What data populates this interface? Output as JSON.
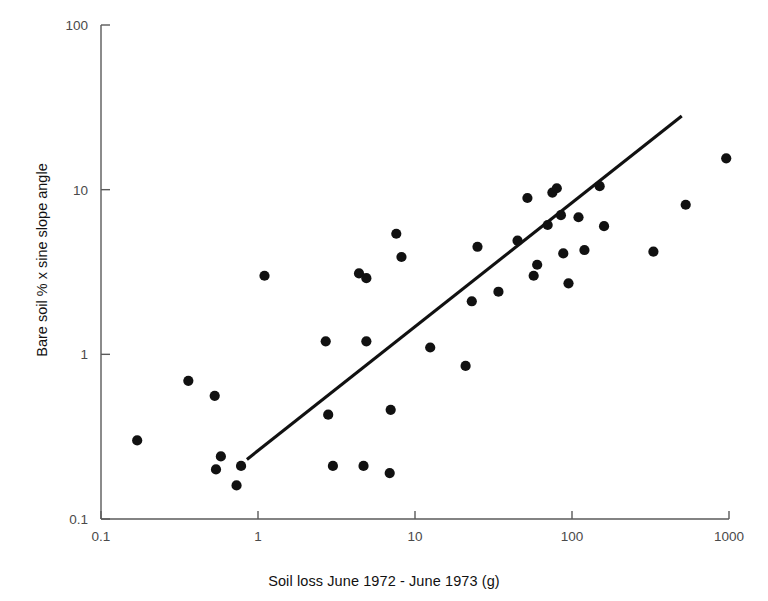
{
  "chart_data": {
    "type": "scatter",
    "title": "",
    "xlabel": "Soil loss June 1972 - June 1973 (g)",
    "ylabel": "Bare soil  % x sine slope angle",
    "xscale": "log",
    "yscale": "log",
    "xlim": [
      0.1,
      1000
    ],
    "ylim": [
      0.1,
      100
    ],
    "grid": false,
    "legend": null,
    "xticks": [
      "0.1",
      "1",
      "10",
      "100",
      "1000"
    ],
    "xtick_values": [
      0.1,
      1,
      10,
      100,
      1000
    ],
    "yticks": [
      "0.1",
      "1",
      "10",
      "100"
    ],
    "ytick_values": [
      0.1,
      1,
      10,
      100
    ],
    "series": [
      {
        "name": "plot-observations",
        "marker": "circle",
        "color": "#111111",
        "points": [
          [
            0.17,
            0.3
          ],
          [
            0.36,
            0.69
          ],
          [
            0.53,
            0.56
          ],
          [
            0.54,
            0.2
          ],
          [
            0.58,
            0.24
          ],
          [
            0.73,
            0.16
          ],
          [
            0.78,
            0.21
          ],
          [
            1.1,
            3.0
          ],
          [
            2.7,
            1.2
          ],
          [
            2.8,
            0.43
          ],
          [
            3.0,
            0.21
          ],
          [
            4.4,
            3.1
          ],
          [
            4.9,
            2.9
          ],
          [
            4.9,
            1.2
          ],
          [
            4.7,
            0.21
          ],
          [
            7.0,
            0.46
          ],
          [
            6.9,
            0.19
          ],
          [
            7.6,
            5.4
          ],
          [
            8.2,
            3.9
          ],
          [
            12.5,
            1.1
          ],
          [
            21.0,
            0.85
          ],
          [
            23.0,
            2.1
          ],
          [
            25.0,
            4.5
          ],
          [
            34.0,
            2.4
          ],
          [
            45.0,
            4.9
          ],
          [
            52.0,
            8.9
          ],
          [
            57.0,
            3.0
          ],
          [
            60.0,
            3.5
          ],
          [
            70.0,
            6.1
          ],
          [
            75.0,
            9.6
          ],
          [
            80.0,
            10.2
          ],
          [
            85.0,
            7.0
          ],
          [
            88.0,
            4.1
          ],
          [
            95.0,
            2.7
          ],
          [
            110.0,
            6.8
          ],
          [
            120.0,
            4.3
          ],
          [
            150.0,
            10.5
          ],
          [
            160.0,
            6.0
          ],
          [
            330.0,
            4.2
          ],
          [
            530.0,
            8.1
          ],
          [
            960.0,
            15.5
          ]
        ]
      }
    ],
    "trend_line": {
      "name": "regression-line",
      "color": "#111111",
      "x_start": 0.85,
      "y_start": 0.23,
      "x_end": 500.0,
      "y_end": 28.0
    },
    "n_points": 41
  }
}
